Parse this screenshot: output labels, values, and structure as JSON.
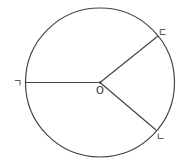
{
  "diagram": {
    "type": "circle-with-radii",
    "stroke_color": "#444444",
    "background": "#ffffff",
    "center": {
      "label": "O",
      "x": 100,
      "y": 82.5
    },
    "radius": 74.5,
    "points": [
      {
        "id": "g",
        "label": "ㄱ",
        "x": 25.5,
        "y": 82.5
      },
      {
        "id": "d",
        "label": "ㄷ",
        "x": 158,
        "y": 36
      },
      {
        "id": "n",
        "label": "ㄴ",
        "x": 156,
        "y": 130
      }
    ]
  }
}
